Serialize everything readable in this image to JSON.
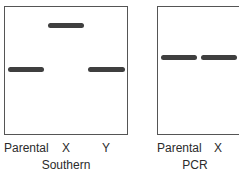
{
  "panels": [
    {
      "title": "Southern",
      "lanes": [
        "Parental",
        "X",
        "Y"
      ]
    },
    {
      "title": "PCR",
      "lanes": [
        "Parental",
        "X"
      ]
    }
  ],
  "colors": {
    "band": "#3f3f3f",
    "border": "#555555",
    "text": "#2b2b2b"
  }
}
